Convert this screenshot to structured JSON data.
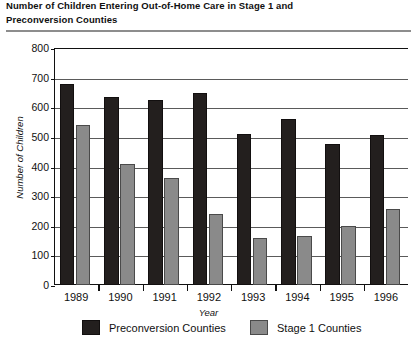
{
  "chart_data": {
    "type": "bar",
    "title": "Number of Children Entering Out-of-Home Care in Stage 1 and Preconversion Counties",
    "title_lines": [
      "Number of Children Entering Out-of-Home Care in Stage 1 and",
      "Preconversion Counties"
    ],
    "xlabel": "Year",
    "ylabel": "Number of Children",
    "categories": [
      "1989",
      "1990",
      "1991",
      "1992",
      "1993",
      "1994",
      "1995",
      "1996"
    ],
    "series": [
      {
        "name": "Preconversion Counties",
        "color": "#231f1e",
        "values": [
          680,
          635,
          625,
          648,
          510,
          560,
          475,
          505
        ]
      },
      {
        "name": "Stage 1 Counties",
        "color": "#8a8a8a",
        "values": [
          540,
          408,
          360,
          240,
          160,
          165,
          200,
          255
        ]
      }
    ],
    "ylim": [
      0,
      800
    ],
    "yticks": [
      0,
      100,
      200,
      300,
      400,
      500,
      600,
      700,
      800
    ],
    "ytick_labels": [
      "0",
      "100",
      "200",
      "300",
      "400",
      "500",
      "600",
      "700",
      "800"
    ],
    "grid": true,
    "grid_axis": "y",
    "legend_position": "bottom"
  }
}
